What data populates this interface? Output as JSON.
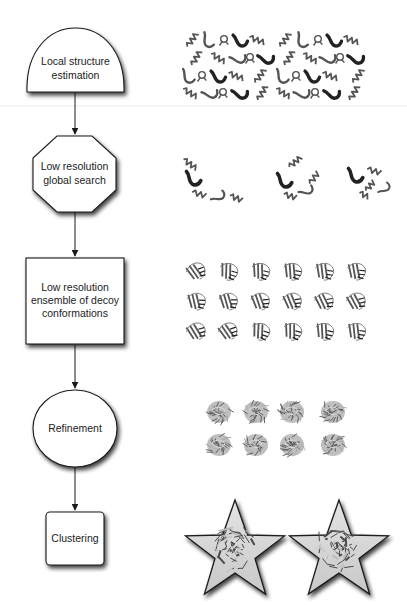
{
  "diagram": {
    "type": "flowchart",
    "direction": "top-to-bottom",
    "nodes": [
      {
        "id": "local",
        "label_lines": [
          "Local structure",
          "estimation"
        ],
        "shape": "semicircle"
      },
      {
        "id": "global",
        "label_lines": [
          "Low resolution",
          "global search"
        ],
        "shape": "octagon"
      },
      {
        "id": "ensemble",
        "label_lines": [
          "Low resolution",
          "ensemble of decoy",
          "conformations"
        ],
        "shape": "rectangle"
      },
      {
        "id": "refine",
        "label_lines": [
          "Refinement"
        ],
        "shape": "circle"
      },
      {
        "id": "cluster",
        "label_lines": [
          "Clustering"
        ],
        "shape": "rounded-square"
      }
    ],
    "edges": [
      {
        "from": "local",
        "to": "global"
      },
      {
        "from": "global",
        "to": "ensemble"
      },
      {
        "from": "ensemble",
        "to": "refine"
      },
      {
        "from": "refine",
        "to": "cluster"
      }
    ],
    "illustrations": [
      {
        "stage": "local",
        "description": "protein fragment library",
        "kind": "fragments",
        "rows": 4,
        "count": 26
      },
      {
        "stage": "global",
        "description": "fragment assembly snapshots",
        "kind": "assembly",
        "count": 3
      },
      {
        "stage": "ensemble",
        "description": "decoy conformations",
        "kind": "decoys",
        "rows": 3,
        "cols": 6
      },
      {
        "stage": "refine",
        "description": "refined all-atom models",
        "kind": "refined",
        "rows": 2,
        "cols": 4
      },
      {
        "stage": "cluster",
        "description": "selected cluster centers",
        "kind": "stars",
        "count": 2
      }
    ],
    "colors": {
      "stroke": "#1a1a1a",
      "fill": "#ffffff",
      "ribbon": "#555555",
      "ribbon_dark": "#222222",
      "star_fill": "#d6d6d6"
    }
  }
}
